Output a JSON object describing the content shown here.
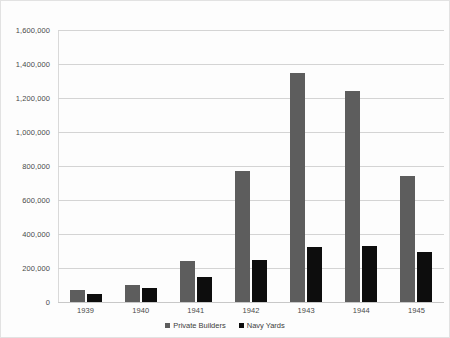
{
  "chart_data": {
    "type": "bar",
    "title": "",
    "subtitle": "",
    "xlabel": "",
    "ylabel": "",
    "categories": [
      "1939",
      "1940",
      "1941",
      "1942",
      "1943",
      "1944",
      "1945"
    ],
    "series": [
      {
        "name": "Private Builders",
        "color": "#5d5d5d",
        "values": [
          70000,
          100000,
          240000,
          770000,
          1350000,
          1240000,
          740000
        ]
      },
      {
        "name": "Navy Yards",
        "color": "#0d0d0d",
        "values": [
          45000,
          80000,
          145000,
          245000,
          325000,
          330000,
          293000
        ]
      }
    ],
    "ylim": [
      0,
      1600000
    ],
    "ytick_step": 200000,
    "ytick_labels": [
      "1,600,000",
      "1,400,000",
      "1,200,000",
      "1,000,000",
      "800,000",
      "600,000",
      "400,000",
      "200,000",
      "0"
    ],
    "ytick_values": [
      1600000,
      1400000,
      1200000,
      1000000,
      800000,
      600000,
      400000,
      200000,
      0
    ],
    "grid": true,
    "legend_position": "bottom",
    "background_color": "#fdfdfd",
    "grid_color": "#d4d4d4",
    "border_color": "#e2e2e2"
  }
}
